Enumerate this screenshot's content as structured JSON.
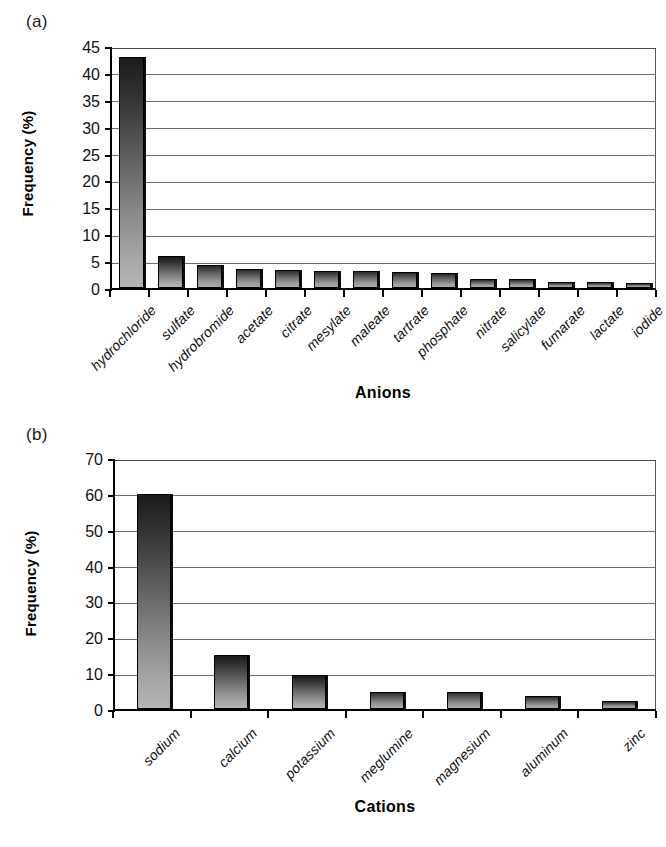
{
  "figure": {
    "panel_a_tag": "(a)",
    "panel_b_tag": "(b)"
  },
  "chart_data": [
    {
      "id": "anions",
      "type": "bar",
      "title": "(a)",
      "xlabel": "Anions",
      "ylabel": "Frequency (%)",
      "ylim": [
        0,
        45
      ],
      "yticks": [
        0,
        5,
        10,
        15,
        20,
        25,
        30,
        35,
        40,
        45
      ],
      "grid": true,
      "legend": "none",
      "categories": [
        "hydrochloride",
        "sulfate",
        "hydrobromide",
        "acetate",
        "citrate",
        "mesylate",
        "maleate",
        "tartrate",
        "phosphate",
        "nitrate",
        "salicylate",
        "fumarate",
        "lactate",
        "iodide"
      ],
      "values": [
        43.0,
        6.0,
        4.2,
        3.5,
        3.3,
        3.1,
        3.1,
        3.0,
        2.7,
        1.6,
        1.6,
        1.1,
        1.1,
        1.0
      ]
    },
    {
      "id": "cations",
      "type": "bar",
      "title": "(b)",
      "xlabel": "Cations",
      "ylabel": "Frequency (%)",
      "ylim": [
        0,
        70
      ],
      "yticks": [
        0,
        10,
        20,
        30,
        40,
        50,
        60,
        70
      ],
      "grid": true,
      "legend": "none",
      "categories": [
        "sodium",
        "calcium",
        "potassium",
        "meglumine",
        "magnesium",
        "aluminum",
        "zinc"
      ],
      "values": [
        60.0,
        15.0,
        9.5,
        4.7,
        4.8,
        3.7,
        2.2
      ]
    }
  ]
}
